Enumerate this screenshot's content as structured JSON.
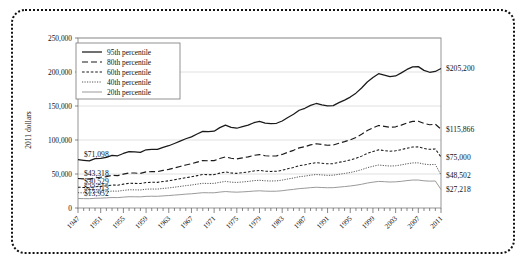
{
  "chart_data": {
    "type": "line",
    "title": "",
    "subtitle": "",
    "xlabel": "",
    "ylabel": "2011 dollars",
    "grid": true,
    "legend_position": "top-left",
    "xlim": [
      1947,
      2011
    ],
    "ylim": [
      0,
      250000
    ],
    "ytick_labels": [
      "0",
      "50,000",
      "100,000",
      "150,000",
      "200,000",
      "250,000"
    ],
    "ytick_values": [
      0,
      50000,
      100000,
      150000,
      200000,
      250000
    ],
    "xtick_labels": [
      "1947",
      "1951",
      "1955",
      "1959",
      "1963",
      "1967",
      "1971",
      "1975",
      "1979",
      "1983",
      "1987",
      "1991",
      "1995",
      "1999",
      "2003",
      "2007",
      "2011"
    ],
    "xtick_values": [
      1947,
      1951,
      1955,
      1959,
      1963,
      1967,
      1971,
      1975,
      1979,
      1983,
      1987,
      1991,
      1995,
      1999,
      2003,
      2007,
      2011
    ],
    "x": [
      1947,
      1948,
      1949,
      1950,
      1951,
      1952,
      1953,
      1954,
      1955,
      1956,
      1957,
      1958,
      1959,
      1960,
      1961,
      1962,
      1963,
      1964,
      1965,
      1966,
      1967,
      1968,
      1969,
      1970,
      1971,
      1972,
      1973,
      1974,
      1975,
      1976,
      1977,
      1978,
      1979,
      1980,
      1981,
      1982,
      1983,
      1984,
      1985,
      1986,
      1987,
      1988,
      1989,
      1990,
      1991,
      1992,
      1993,
      1994,
      1995,
      1996,
      1997,
      1998,
      1999,
      2000,
      2001,
      2002,
      2003,
      2004,
      2005,
      2006,
      2007,
      2008,
      2009,
      2010,
      2011
    ],
    "series": [
      {
        "name": "95th percentile",
        "style": "solid-thick",
        "start_value": 71098,
        "end_value": 205200,
        "start_label": "$71,098",
        "end_label": "$205,200",
        "values": [
          71098,
          70200,
          69400,
          72600,
          73100,
          74400,
          77500,
          76800,
          80200,
          82900,
          82400,
          81800,
          85600,
          86300,
          86100,
          89100,
          91600,
          94900,
          98300,
          101800,
          104600,
          108900,
          112600,
          112400,
          112900,
          118200,
          121800,
          118600,
          117300,
          119600,
          121900,
          125400,
          127300,
          124800,
          124100,
          124600,
          127900,
          133200,
          137900,
          143800,
          146600,
          150900,
          153700,
          151800,
          150200,
          150600,
          154900,
          158700,
          163100,
          168900,
          176400,
          185300,
          192000,
          197500,
          195300,
          193100,
          194200,
          198700,
          203800,
          207600,
          207900,
          202400,
          199600,
          200800,
          205200
        ]
      },
      {
        "name": "80th percentile",
        "style": "dashed",
        "start_value": 43318,
        "end_value": 115866,
        "start_label": "$43,318",
        "end_label": "$115,866",
        "values": [
          43318,
          42900,
          42400,
          44300,
          45200,
          46100,
          48000,
          47600,
          49800,
          51500,
          51400,
          50900,
          53100,
          53600,
          53500,
          55300,
          56800,
          58900,
          61000,
          63300,
          65000,
          67500,
          69800,
          69500,
          69700,
          72800,
          75200,
          73100,
          72200,
          73700,
          75200,
          77400,
          78500,
          76900,
          76400,
          76700,
          78800,
          82000,
          84800,
          88400,
          90100,
          92800,
          94500,
          93400,
          92300,
          92600,
          95200,
          97600,
          100300,
          103800,
          108400,
          113900,
          118000,
          121400,
          120000,
          118700,
          119400,
          121900,
          125000,
          127400,
          127600,
          124300,
          122500,
          123200,
          115866
        ]
      },
      {
        "name": "60th percentile",
        "style": "fine-dashed",
        "start_value": 30529,
        "end_value": 75000,
        "start_label": "$30,529",
        "end_label": "$75,000",
        "values": [
          30529,
          30200,
          29900,
          31200,
          31800,
          32500,
          33800,
          33500,
          35100,
          36300,
          36200,
          35900,
          37400,
          37800,
          37700,
          39000,
          40000,
          41500,
          43000,
          44600,
          45800,
          47600,
          49200,
          49000,
          49100,
          51300,
          53000,
          51500,
          50900,
          51900,
          53000,
          54500,
          55300,
          54200,
          53800,
          54000,
          55500,
          57800,
          59700,
          62300,
          63500,
          65400,
          66600,
          65800,
          65000,
          65200,
          67100,
          68700,
          70600,
          73100,
          76300,
          80200,
          83100,
          85500,
          84500,
          83600,
          84100,
          85800,
          88000,
          89700,
          89900,
          87500,
          86300,
          86800,
          75000
        ]
      },
      {
        "name": "40th percentile",
        "style": "dotted",
        "start_value": 22513,
        "end_value": 48502,
        "start_label": "$22,513",
        "end_label": "$48,502",
        "values": [
          22513,
          22300,
          22100,
          23000,
          23400,
          24000,
          24900,
          24700,
          25900,
          26800,
          26700,
          26500,
          27600,
          27900,
          27800,
          28800,
          29500,
          30600,
          31700,
          32900,
          33800,
          35100,
          36300,
          36100,
          36200,
          37800,
          39100,
          38000,
          37600,
          38300,
          39100,
          40200,
          40800,
          40000,
          39700,
          39900,
          41000,
          42700,
          44100,
          46000,
          46900,
          48300,
          49200,
          48600,
          48000,
          48200,
          49600,
          50800,
          52200,
          54000,
          56400,
          59200,
          61400,
          63200,
          62400,
          61700,
          62100,
          63400,
          65000,
          66300,
          66400,
          64600,
          63700,
          64100,
          48502
        ]
      },
      {
        "name": "20th percentile",
        "style": "thin-solid",
        "start_value": 13952,
        "end_value": 27218,
        "start_label": "$13,952",
        "end_label": "$27,218",
        "values": [
          13952,
          13800,
          13700,
          14300,
          14500,
          14900,
          15400,
          15300,
          16000,
          16600,
          16500,
          16400,
          17100,
          17300,
          17200,
          17800,
          18300,
          19000,
          19600,
          20400,
          20900,
          21700,
          22500,
          22400,
          22400,
          23400,
          24200,
          23600,
          23300,
          23700,
          24200,
          24900,
          25300,
          24800,
          24600,
          24700,
          25400,
          26500,
          27400,
          28500,
          29100,
          29900,
          30500,
          30100,
          29800,
          29900,
          30700,
          31500,
          32400,
          33500,
          34900,
          36700,
          38000,
          39100,
          38700,
          38200,
          38500,
          39200,
          40300,
          41100,
          41100,
          40000,
          39500,
          39700,
          27218
        ]
      }
    ]
  },
  "frame": {
    "border_style": "dotted"
  },
  "colors": {
    "p95": "#1a1a1a",
    "p80": "#1a1a1a",
    "p60": "#1a1a1a",
    "p40": "#555555",
    "p20": "#9a9a9a",
    "grid": "#d8d8d8",
    "axis": "#555555",
    "text": "#111111"
  }
}
